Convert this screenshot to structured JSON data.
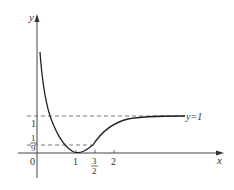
{
  "figure": {
    "axes": {
      "x_label": "x",
      "y_label": "y",
      "origin_label": "0"
    },
    "x_ticks": [
      {
        "label": "1",
        "value": 1
      },
      {
        "label_num": "3",
        "label_den": "2",
        "value": 1.5
      },
      {
        "label": "2",
        "value": 2
      }
    ],
    "y_ticks": [
      {
        "label": "1",
        "value": 1
      },
      {
        "label_num": "1",
        "label_den": "9",
        "value": 0.1111
      }
    ],
    "asymptote_label": "y=1",
    "colors": {
      "axis": "#444444",
      "curve": "#222222",
      "dashed": "#666666"
    }
  }
}
